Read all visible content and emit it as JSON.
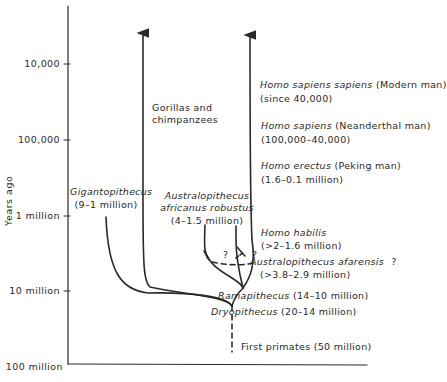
{
  "figure": {
    "axis": {
      "ylabel": "Years ago",
      "ticks": [
        {
          "label": "10,000",
          "y": 64
        },
        {
          "label": "100,000",
          "y": 140
        },
        {
          "label": "1 million",
          "y": 216
        },
        {
          "label": "10 million",
          "y": 291
        },
        {
          "label": "100 million",
          "y": 366
        }
      ]
    },
    "lineages": {
      "gorillas": {
        "line1": "Gorillas and",
        "line2": "chimpanzees"
      },
      "modern_man": {
        "name": "Homo sapiens sapiens",
        "common": "(Modern man)",
        "range": "(since 40,000)"
      },
      "neanderthal": {
        "name": "Homo sapiens",
        "common": "(Neanderthal man)",
        "range": "(100,000–40,000)"
      },
      "erectus": {
        "name": "Homo erectus",
        "common": "(Peking man)",
        "range": "(1.6–0.1 million)"
      },
      "habilis": {
        "name": "Homo habilis",
        "range": "(>2–1.6 million)"
      },
      "afarensis": {
        "name": "Australopithecus afarensis",
        "query": "?",
        "range": "(>3.8–2.9 million)"
      },
      "robustus": {
        "name1": "Australopithecus",
        "name2": "africanus robustus",
        "range": "(4–1.5 million)"
      },
      "gigantopithecus": {
        "name": "Gigantopithecus",
        "range": "(9–1 million)"
      },
      "ramapithecus": {
        "name": "Ramapithecus",
        "range": "(14–10 million)"
      },
      "dryopithecus": {
        "name": "Dryopithecus",
        "range": "(20–14 million)"
      },
      "first_primates": {
        "label": "First primates (50 million)"
      }
    },
    "uncertain_marks": [
      "?",
      "?"
    ],
    "colors": {
      "ink": "#2a2a2a",
      "background": "#ffffff"
    }
  }
}
